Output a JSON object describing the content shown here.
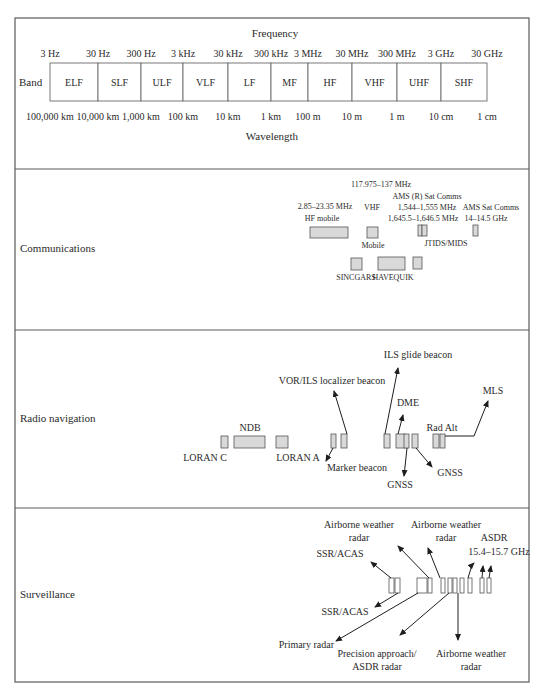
{
  "figure": {
    "frequency_title": "Frequency",
    "wavelength_title": "Wavelength",
    "band_label": "Band",
    "frequency_ticks": [
      {
        "label": "3 Hz",
        "x": 50
      },
      {
        "label": "30 Hz",
        "x": 98
      },
      {
        "label": "300 Hz",
        "x": 141
      },
      {
        "label": "3 kHz",
        "x": 183
      },
      {
        "label": "30 kHz",
        "x": 228
      },
      {
        "label": "300 kHz",
        "x": 271
      },
      {
        "label": "3 MHz",
        "x": 308
      },
      {
        "label": "30 MHz",
        "x": 352
      },
      {
        "label": "300 MHz",
        "x": 397
      },
      {
        "label": "3 GHz",
        "x": 441
      },
      {
        "label": "30 GHz",
        "x": 487
      }
    ],
    "wavelength_ticks": [
      "100,000 km",
      "10,000 km",
      "1,000 km",
      "100 km",
      "10 km",
      "1 km",
      "100 m",
      "10 m",
      "1 m",
      "10 cm",
      "1 cm"
    ],
    "bands": [
      "ELF",
      "SLF",
      "ULF",
      "VLF",
      "LF",
      "MF",
      "HF",
      "VHF",
      "UHF",
      "SHF"
    ]
  },
  "sections": {
    "communications": {
      "title": "Communications",
      "labels": [
        {
          "id": "vhf_range",
          "text": "117.975–137 MHz",
          "x": 381,
          "y": 187
        },
        {
          "id": "ams_r_title",
          "text": "AMS (R) Sat Comms",
          "x": 427,
          "y": 199
        },
        {
          "id": "hf_range",
          "text": "2.85–23.35 MHz",
          "x": 325,
          "y": 209
        },
        {
          "id": "vhf",
          "text": "VHF",
          "x": 372,
          "y": 210
        },
        {
          "id": "ams_r_range1",
          "text": "1,544–1,555 MHz",
          "x": 427,
          "y": 210
        },
        {
          "id": "ams_title",
          "text": "AMS Sat Comms",
          "x": 491,
          "y": 210
        },
        {
          "id": "hf_mobile",
          "text": "HF mobile",
          "x": 322,
          "y": 221
        },
        {
          "id": "ams_r_range2",
          "text": "1,645.5–1,646.5 MHz",
          "x": 423,
          "y": 221
        },
        {
          "id": "ams_range",
          "text": "14–14.5 GHz",
          "x": 486,
          "y": 221
        },
        {
          "id": "mobile",
          "text": "Mobile",
          "x": 373,
          "y": 248
        },
        {
          "id": "jtids",
          "text": "JTIDS/MIDS",
          "x": 446,
          "y": 246
        },
        {
          "id": "sincgars",
          "text": "SINCGARS",
          "x": 356,
          "y": 280
        },
        {
          "id": "havequik",
          "text": "HAVEQUIK",
          "x": 393,
          "y": 280
        }
      ],
      "allocations": [
        {
          "x": 310,
          "y": 227,
          "w": 38,
          "h": 11
        },
        {
          "x": 367,
          "y": 227,
          "w": 11,
          "h": 11
        },
        {
          "x": 418,
          "y": 225,
          "w": 4,
          "h": 11
        },
        {
          "x": 422,
          "y": 225,
          "w": 5,
          "h": 11
        },
        {
          "x": 473,
          "y": 225,
          "w": 5,
          "h": 11
        },
        {
          "x": 351,
          "y": 258,
          "w": 11,
          "h": 12
        },
        {
          "x": 378,
          "y": 257,
          "w": 27,
          "h": 13
        },
        {
          "x": 413,
          "y": 257,
          "w": 9,
          "h": 12
        }
      ]
    },
    "radio_navigation": {
      "title": "Radio navigation",
      "labels": [
        {
          "id": "ils_glide",
          "text": "ILS glide beacon",
          "x": 418,
          "y": 358,
          "anchor": "middle"
        },
        {
          "id": "vor_ils",
          "text": "VOR/ILS localizer beacon",
          "x": 332,
          "y": 384,
          "anchor": "middle"
        },
        {
          "id": "mls",
          "text": "MLS",
          "x": 493,
          "y": 394,
          "anchor": "middle"
        },
        {
          "id": "dme",
          "text": "DME",
          "x": 408,
          "y": 406,
          "anchor": "middle"
        },
        {
          "id": "ndb",
          "text": "NDB",
          "x": 250,
          "y": 431,
          "anchor": "middle"
        },
        {
          "id": "rad_alt",
          "text": "Rad Alt",
          "x": 442,
          "y": 431,
          "anchor": "middle"
        },
        {
          "id": "loran_c",
          "text": "LORAN C",
          "x": 205,
          "y": 461,
          "anchor": "middle"
        },
        {
          "id": "loran_a",
          "text": "LORAN A",
          "x": 298,
          "y": 461,
          "anchor": "middle"
        },
        {
          "id": "marker",
          "text": "Marker beacon",
          "x": 357,
          "y": 471,
          "anchor": "middle"
        },
        {
          "id": "gnss_right",
          "text": "GNSS",
          "x": 450,
          "y": 476,
          "anchor": "middle"
        },
        {
          "id": "gnss_low",
          "text": "GNSS",
          "x": 400,
          "y": 488,
          "anchor": "middle"
        }
      ],
      "allocations": [
        {
          "x": 221,
          "y": 436,
          "w": 7,
          "h": 12
        },
        {
          "x": 234,
          "y": 436,
          "w": 31,
          "h": 12
        },
        {
          "x": 276,
          "y": 436,
          "w": 12,
          "h": 12
        },
        {
          "x": 331,
          "y": 434,
          "w": 5,
          "h": 14
        },
        {
          "x": 341,
          "y": 434,
          "w": 6,
          "h": 14
        },
        {
          "x": 384,
          "y": 434,
          "w": 6,
          "h": 14
        },
        {
          "x": 396,
          "y": 434,
          "w": 9,
          "h": 14
        },
        {
          "x": 404,
          "y": 434,
          "w": 5,
          "h": 14
        },
        {
          "x": 412,
          "y": 434,
          "w": 6,
          "h": 14
        },
        {
          "x": 433,
          "y": 434,
          "w": 6,
          "h": 14
        },
        {
          "x": 440,
          "y": 434,
          "w": 5,
          "h": 14
        }
      ],
      "arrows": [
        {
          "d": "M347,434 L334,391"
        },
        {
          "d": "M385,434 L398,368"
        },
        {
          "d": "M398,434 L403,415"
        },
        {
          "d": "M407,448 L404,476"
        },
        {
          "d": "M416,448 L432,467"
        },
        {
          "d": "M333,448 L326,461"
        },
        {
          "d": "M445,436 L474,436 L488,401"
        }
      ]
    },
    "surveillance": {
      "title": "Surveillance",
      "labels": [
        {
          "id": "awr_top1_l1",
          "text": "Airborne weather",
          "x": 359,
          "y": 528,
          "anchor": "middle"
        },
        {
          "id": "awr_top1_l2",
          "text": "radar",
          "x": 359,
          "y": 541,
          "anchor": "middle"
        },
        {
          "id": "awr_top2_l1",
          "text": "Airborne weather",
          "x": 446,
          "y": 528,
          "anchor": "middle"
        },
        {
          "id": "awr_top2_l2",
          "text": "radar",
          "x": 446,
          "y": 541,
          "anchor": "middle"
        },
        {
          "id": "asdr",
          "text": "ASDR",
          "x": 494,
          "y": 541,
          "anchor": "middle"
        },
        {
          "id": "asdr_range",
          "text": "15.4–15.7 GHz",
          "x": 499,
          "y": 555,
          "anchor": "middle"
        },
        {
          "id": "ssr_top",
          "text": "SSR/ACAS",
          "x": 340,
          "y": 557,
          "anchor": "middle"
        },
        {
          "id": "ssr_low",
          "text": "SSR/ACAS",
          "x": 345,
          "y": 615,
          "anchor": "middle"
        },
        {
          "id": "primary",
          "text": "Primary radar",
          "x": 334,
          "y": 648,
          "anchor": "end"
        },
        {
          "id": "pa_l1",
          "text": "Precision approach/",
          "x": 377,
          "y": 657,
          "anchor": "middle"
        },
        {
          "id": "pa_l2",
          "text": "ASDR radar",
          "x": 377,
          "y": 670,
          "anchor": "middle"
        },
        {
          "id": "awr_low_l1",
          "text": "Airborne weather",
          "x": 471,
          "y": 657,
          "anchor": "middle"
        },
        {
          "id": "awr_low_l2",
          "text": "radar",
          "x": 471,
          "y": 670,
          "anchor": "middle"
        }
      ],
      "allocations": [
        {
          "x": 389,
          "y": 578,
          "w": 5,
          "h": 15
        },
        {
          "x": 395,
          "y": 578,
          "w": 5,
          "h": 15
        },
        {
          "x": 417,
          "y": 578,
          "w": 10,
          "h": 15
        },
        {
          "x": 428,
          "y": 578,
          "w": 4,
          "h": 15
        },
        {
          "x": 441,
          "y": 578,
          "w": 4,
          "h": 15
        },
        {
          "x": 448,
          "y": 578,
          "w": 4,
          "h": 15
        },
        {
          "x": 453,
          "y": 578,
          "w": 4,
          "h": 15
        },
        {
          "x": 460,
          "y": 578,
          "w": 4,
          "h": 15
        },
        {
          "x": 468,
          "y": 578,
          "w": 4,
          "h": 15
        },
        {
          "x": 480,
          "y": 578,
          "w": 4,
          "h": 15
        },
        {
          "x": 487,
          "y": 578,
          "w": 4,
          "h": 15
        }
      ],
      "arrows": [
        {
          "d": "M391,578 L371,562"
        },
        {
          "d": "M398,593 L375,607"
        },
        {
          "d": "M429,578 L398,546"
        },
        {
          "d": "M440,578 L428,548"
        },
        {
          "d": "M418,593 L336,641"
        },
        {
          "d": "M449,593 L400,635"
        },
        {
          "d": "M458,593 L458,640"
        },
        {
          "d": "M468,578 L472,565 L474,563"
        },
        {
          "d": "M482,578 L483,566"
        },
        {
          "d": "M489,578 L491,566"
        }
      ]
    }
  }
}
